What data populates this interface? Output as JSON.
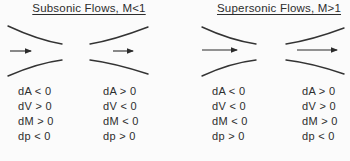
{
  "diagram_title": "Converging-diverging duct flow relations",
  "colors": {
    "background": "#fbfbfb",
    "line": "#333333",
    "text": "#2d2d2d"
  },
  "panels": [
    {
      "id": "subsonic",
      "title": "Subsonic Flows, M<1",
      "sections": [
        {
          "type": "converging-duct",
          "relations": [
            "dA < 0",
            "dV > 0",
            "dM > 0",
            "dp < 0"
          ]
        },
        {
          "type": "diverging-duct",
          "relations": [
            "dA > 0",
            "dV < 0",
            "dM < 0",
            "dp > 0"
          ]
        }
      ]
    },
    {
      "id": "supersonic",
      "title": "Supersonic Flows, M>1",
      "sections": [
        {
          "type": "converging-duct",
          "relations": [
            "dA < 0",
            "dV < 0",
            "dM < 0",
            "dp > 0"
          ]
        },
        {
          "type": "diverging-duct",
          "relations": [
            "dA > 0",
            "dV > 0",
            "dM > 0",
            "dp < 0"
          ]
        }
      ]
    }
  ]
}
